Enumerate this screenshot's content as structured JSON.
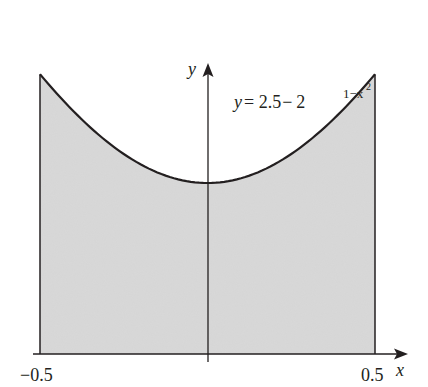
{
  "chart_data": {
    "type": "area",
    "title": "",
    "function_label": {
      "prefix": "y",
      "equals": "= 2.5",
      "minus": "−",
      "base": "2",
      "exponent": "1−x",
      "exponent_power": "2"
    },
    "xlabel": "x",
    "ylabel": "y",
    "x_ticks": [
      "−0.5",
      "0.5"
    ],
    "xlim": [
      -0.5,
      0.5
    ],
    "ylim": [
      0,
      0.82
    ],
    "grid": false,
    "legend": "none",
    "x": [
      -0.5,
      -0.4,
      -0.3,
      -0.2,
      -0.1,
      0.0,
      0.1,
      0.2,
      0.3,
      0.4,
      0.5
    ],
    "values": [
      0.818,
      0.697,
      0.604,
      0.54,
      0.51,
      0.5,
      0.51,
      0.54,
      0.604,
      0.697,
      0.818
    ],
    "fill_color": "#d9d9d9",
    "line_color": "#231f20"
  },
  "pixel_map": {
    "x0_px": 40,
    "x1_px": 375,
    "yaxis_px": 208,
    "y0_px": 354,
    "px_per_unit_y": 342
  }
}
